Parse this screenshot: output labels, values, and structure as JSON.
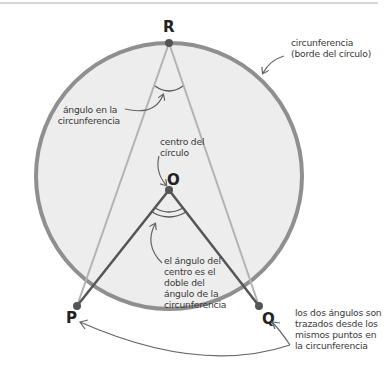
{
  "diagram": {
    "type": "geometry-circle-theorem",
    "colors": {
      "circle_fill": "#ededed",
      "circle_stroke": "#8f8f8f",
      "chord_light": "#b3b3b3",
      "radius_dark": "#555555",
      "point": "#555555",
      "arrow": "#666666",
      "text": "#3a3a3a",
      "top_rule": "#c8c8c8"
    },
    "points": {
      "R": "R",
      "O": "O",
      "P": "P",
      "Q": "Q"
    },
    "labels": {
      "circumference": [
        "circunferencia",
        "(borde del círculo)"
      ],
      "angle_at_circumference": [
        "ángulo en la",
        "circunferencia"
      ],
      "centre_of_circle": [
        "centro del",
        "círculo"
      ],
      "angle_at_centre": [
        "el ángulo del",
        "centro es el",
        "doble del",
        "ángulo de la",
        "circunferencia"
      ],
      "same_points": [
        "los dos ángulos son",
        "trazados desde los",
        "mismos puntos en",
        "la circunferencia"
      ]
    }
  }
}
